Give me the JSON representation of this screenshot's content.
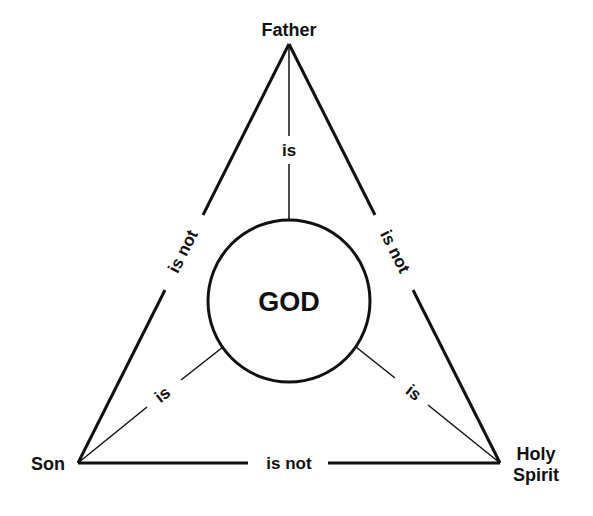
{
  "diagram": {
    "type": "shield-of-the-trinity",
    "colors": {
      "stroke": "#111111",
      "background": "#ffffff",
      "text": "#111111"
    },
    "center": {
      "label": "GOD"
    },
    "nodes": [
      {
        "id": "father",
        "label": "Father"
      },
      {
        "id": "son",
        "label": "Son"
      },
      {
        "id": "holy-spirit",
        "label_line1": "Holy",
        "label_line2": "Spirit"
      }
    ],
    "edges": {
      "father_son": "is not",
      "father_spirit": "is not",
      "son_spirit": "is not",
      "father_god": "is",
      "son_god": "is",
      "spirit_god": "is"
    }
  }
}
